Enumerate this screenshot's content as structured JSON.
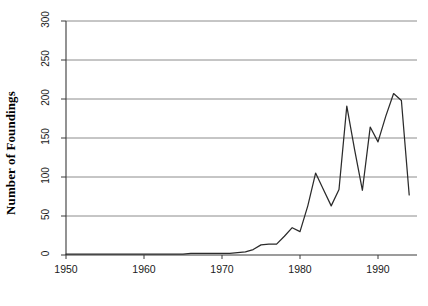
{
  "chart_data": {
    "type": "line",
    "title": "",
    "xlabel": "",
    "ylabel": "Number of Foundings",
    "xlim": [
      1950,
      1995
    ],
    "ylim": [
      0,
      300
    ],
    "grid": true,
    "legend": "none",
    "xticks": [
      1950,
      1960,
      1970,
      1980,
      1990
    ],
    "yticks": [
      0,
      50,
      100,
      150,
      200,
      250,
      300
    ],
    "series": [
      {
        "name": "Foundings",
        "x": [
          1950,
          1951,
          1952,
          1953,
          1954,
          1955,
          1956,
          1957,
          1958,
          1959,
          1960,
          1961,
          1962,
          1963,
          1964,
          1965,
          1966,
          1967,
          1968,
          1969,
          1970,
          1971,
          1972,
          1973,
          1974,
          1975,
          1976,
          1977,
          1978,
          1979,
          1980,
          1981,
          1982,
          1983,
          1984,
          1985,
          1986,
          1987,
          1988,
          1989,
          1990,
          1991,
          1992,
          1993,
          1994
        ],
        "values": [
          1,
          1,
          1,
          1,
          1,
          1,
          1,
          1,
          1,
          1,
          1,
          1,
          1,
          1,
          1,
          1,
          2,
          2,
          2,
          2,
          2,
          2,
          3,
          4,
          7,
          13,
          14,
          14,
          24,
          35,
          30,
          63,
          105,
          84,
          63,
          84,
          191,
          135,
          83,
          164,
          145,
          178,
          207,
          198,
          77
        ]
      }
    ]
  },
  "axis": {
    "y_title": "Number of Foundings",
    "ytick_labels": [
      "0",
      "50",
      "100",
      "150",
      "200",
      "250",
      "300"
    ],
    "xtick_labels": [
      "1950",
      "1960",
      "1970",
      "1980",
      "1990"
    ]
  },
  "style": {
    "line_color": "#2b2b2b",
    "grid_color": "#8c8c8c",
    "axis_color": "#3a3a3a",
    "background": "#ffffff"
  }
}
